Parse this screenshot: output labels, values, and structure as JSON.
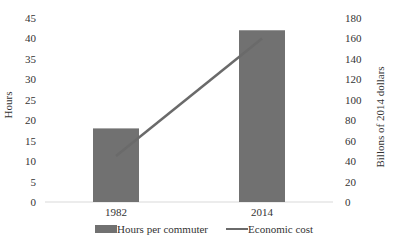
{
  "chart_data": {
    "type": "bar",
    "title": "",
    "title_cropped": true,
    "categories": [
      "1982",
      "2014"
    ],
    "series": [
      {
        "name": "Hours per commuter",
        "type": "bar",
        "axis": "left",
        "values": [
          18,
          42
        ],
        "color": "#717171"
      },
      {
        "name": "Economic cost",
        "type": "line",
        "axis": "right",
        "values": [
          45,
          160
        ],
        "color": "#6a6a6a"
      }
    ],
    "xlabel": "",
    "ylabel": "Hours",
    "ylabel_right": "Billons of 2014 dollars",
    "ylim": [
      0,
      45
    ],
    "ylim_right": [
      0,
      180
    ],
    "yticks": [
      0,
      5,
      10,
      15,
      20,
      25,
      30,
      35,
      40,
      45
    ],
    "yticks_right": [
      0,
      20,
      40,
      60,
      80,
      100,
      120,
      140,
      160,
      180
    ],
    "grid": false,
    "legend_position": "bottom"
  },
  "legend": {
    "bar_label": "Hours per commuter",
    "line_label": "Economic cost"
  },
  "axes": {
    "left_title": "Hours",
    "right_title": "Billons of 2014 dollars"
  }
}
